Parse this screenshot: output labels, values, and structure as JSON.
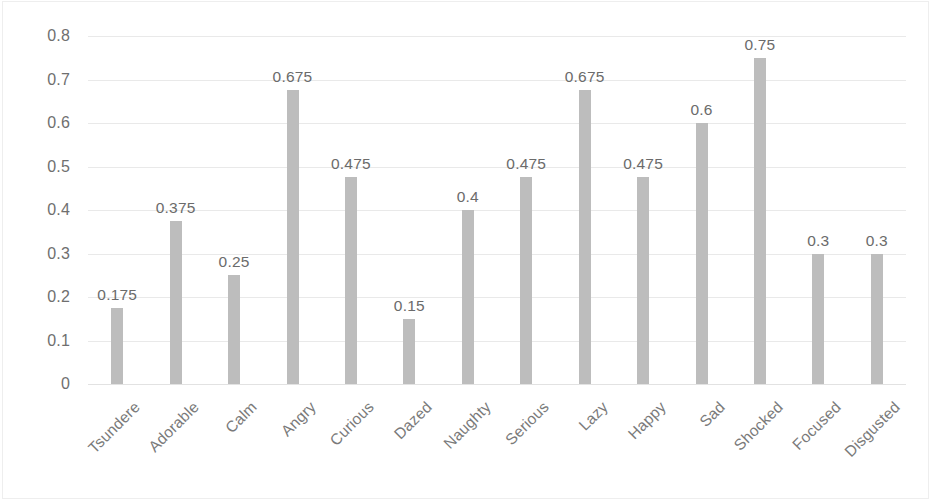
{
  "chart_data": {
    "type": "bar",
    "title": "",
    "subtitle": "",
    "xlabel": "",
    "ylabel": "",
    "categories": [
      "Tsundere",
      "Adorable",
      "Calm",
      "Angry",
      "Curious",
      "Dazed",
      "Naughty",
      "Serious",
      "Lazy",
      "Happy",
      "Sad",
      "Shocked",
      "Focused",
      "Disgusted"
    ],
    "values": [
      0.175,
      0.375,
      0.25,
      0.675,
      0.475,
      0.15,
      0.4,
      0.475,
      0.675,
      0.475,
      0.6,
      0.75,
      0.3,
      0.3
    ],
    "value_labels": [
      "0.175",
      "0.375",
      "0.25",
      "0.675",
      "0.475",
      "0.15",
      "0.4",
      "0.475",
      "0.675",
      "0.475",
      "0.6",
      "0.75",
      "0.3",
      "0.3"
    ],
    "ylim": [
      0,
      0.8
    ],
    "y_ticks": [
      0.8,
      0.7,
      0.6,
      0.5,
      0.4,
      0.3,
      0.2,
      0.1,
      0
    ],
    "y_tick_labels": [
      "0.8",
      "0.7",
      "0.6",
      "0.5",
      "0.4",
      "0.3",
      "0.2",
      "0.1",
      "0"
    ],
    "grid": true,
    "legend": false,
    "legend_position": "none",
    "data_labels": true,
    "bar_color": "#bdbdbd",
    "gridline_color": "#e9e9e9",
    "axis_text_color": "#6f6f6f",
    "background_color": "#ffffff"
  }
}
